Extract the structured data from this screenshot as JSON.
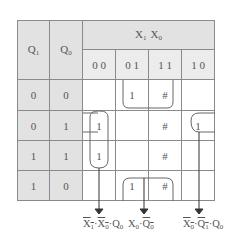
{
  "header": {
    "row_var_1": "Q",
    "row_var_1_sub": "1",
    "row_var_0": "Q",
    "row_var_0_sub": "0",
    "col_var_1": "X",
    "col_var_1_sub": "1",
    "col_var_0": "X",
    "col_var_0_sub": "0",
    "col_codes": [
      "0 0",
      "0 1",
      "1 1",
      "1 0"
    ]
  },
  "rows": [
    {
      "q1": "0",
      "q0": "0",
      "cells": [
        "",
        "1",
        "#",
        ""
      ]
    },
    {
      "q1": "0",
      "q1b": "",
      "q0": "1",
      "cells": [
        "1",
        "",
        "#",
        "1"
      ]
    },
    {
      "q1": "1",
      "q0": "1",
      "cells": [
        "1",
        "",
        "#",
        ""
      ]
    },
    {
      "q1": "1",
      "q0": "0",
      "cells": [
        "",
        "1",
        "#",
        ""
      ]
    }
  ],
  "terms": [
    {
      "parts": [
        {
          "t": "X",
          "s": "1",
          "bar": true
        },
        {
          "t": "·"
        },
        {
          "t": "X",
          "s": "0",
          "bar": true
        },
        {
          "t": "·"
        },
        {
          "t": "Q",
          "s": "0",
          "bar": false
        }
      ]
    },
    {
      "parts": [
        {
          "t": "X",
          "s": "0",
          "bar": false
        },
        {
          "t": "·"
        },
        {
          "t": "Q",
          "s": "0",
          "bar": true
        }
      ]
    },
    {
      "parts": [
        {
          "t": "X",
          "s": "0",
          "bar": true
        },
        {
          "t": "·"
        },
        {
          "t": "Q",
          "s": "1",
          "bar": true
        },
        {
          "t": "·"
        },
        {
          "t": "Q",
          "s": "0",
          "bar": false
        }
      ]
    }
  ],
  "colors": {
    "header_bg": "#e2e2e2",
    "line": "#8a8a8a",
    "text": "#555555"
  }
}
